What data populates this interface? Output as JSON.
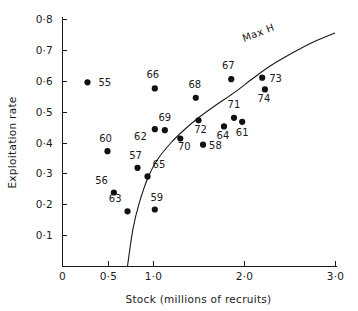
{
  "chart_data": {
    "type": "scatter",
    "title": "",
    "xlabel": "Stock (millions of recruits)",
    "ylabel": "Exploitation rate",
    "xlim": [
      0,
      3.0
    ],
    "ylim": [
      0,
      0.8
    ],
    "grid": false,
    "legend": "none",
    "xticks": [
      {
        "value": 0,
        "label": "0"
      },
      {
        "value": 0.5,
        "label": "0·5"
      },
      {
        "value": 1.0,
        "label": "1·0"
      },
      {
        "value": 2.0,
        "label": "2·0"
      },
      {
        "value": 3.0,
        "label": "3·0"
      }
    ],
    "yticks": [
      {
        "value": 0.1,
        "label": "0·1"
      },
      {
        "value": 0.2,
        "label": "0·2"
      },
      {
        "value": 0.3,
        "label": "0·3"
      },
      {
        "value": 0.4,
        "label": "0·4"
      },
      {
        "value": 0.5,
        "label": "0·5"
      },
      {
        "value": 0.6,
        "label": "0·6"
      },
      {
        "value": 0.7,
        "label": "0·7"
      },
      {
        "value": 0.8,
        "label": "0·8"
      }
    ],
    "points": [
      {
        "label": "55",
        "x": 0.28,
        "y": 0.595,
        "lx": 11,
        "ly": 4
      },
      {
        "label": "60",
        "x": 0.5,
        "y": 0.372,
        "lx": -2,
        "ly": -9
      },
      {
        "label": "56",
        "x": 0.57,
        "y": 0.238,
        "lx": -6,
        "ly": -9
      },
      {
        "label": "63",
        "x": 0.72,
        "y": 0.177,
        "lx": -6,
        "ly": -9
      },
      {
        "label": "57",
        "x": 0.83,
        "y": 0.318,
        "lx": -2,
        "ly": -9
      },
      {
        "label": "65",
        "x": 0.94,
        "y": 0.29,
        "lx": 5,
        "ly": -8
      },
      {
        "label": "59",
        "x": 1.02,
        "y": 0.183,
        "lx": 2,
        "ly": -9
      },
      {
        "label": "66",
        "x": 1.02,
        "y": 0.575,
        "lx": -2,
        "ly": -10
      },
      {
        "label": "62",
        "x": 1.02,
        "y": 0.443,
        "lx": -8,
        "ly": 11
      },
      {
        "label": "69",
        "x": 1.13,
        "y": 0.44,
        "lx": 0,
        "ly": -9
      },
      {
        "label": "70",
        "x": 1.3,
        "y": 0.413,
        "lx": 4,
        "ly": 12
      },
      {
        "label": "68",
        "x": 1.47,
        "y": 0.545,
        "lx": -1,
        "ly": -10
      },
      {
        "label": "72",
        "x": 1.5,
        "y": 0.472,
        "lx": 2,
        "ly": 13
      },
      {
        "label": "58",
        "x": 1.55,
        "y": 0.393,
        "lx": 6,
        "ly": 4
      },
      {
        "label": "64",
        "x": 1.78,
        "y": 0.452,
        "lx": -1,
        "ly": 13
      },
      {
        "label": "67",
        "x": 1.86,
        "y": 0.605,
        "lx": -3,
        "ly": -10
      },
      {
        "label": "71",
        "x": 1.89,
        "y": 0.48,
        "lx": 0,
        "ly": -10
      },
      {
        "label": "61",
        "x": 1.98,
        "y": 0.467,
        "lx": 0,
        "ly": 14
      },
      {
        "label": "73",
        "x": 2.2,
        "y": 0.61,
        "lx": 7,
        "ly": 4
      },
      {
        "label": "74",
        "x": 2.23,
        "y": 0.572,
        "lx": -1,
        "ly": 13
      }
    ],
    "annotations": [
      {
        "name": "max-h",
        "text": "Max H",
        "x": 2.17,
        "y": 0.745,
        "rotate": -21
      }
    ],
    "curve": {
      "name": "Max H curve",
      "x_start": 0.72,
      "y_start": 0.0,
      "x_end": 3.0,
      "y_end": 0.755,
      "samples": [
        {
          "x": 0.72,
          "y": 0.0
        },
        {
          "x": 0.78,
          "y": 0.12
        },
        {
          "x": 0.85,
          "y": 0.205
        },
        {
          "x": 0.95,
          "y": 0.29
        },
        {
          "x": 1.05,
          "y": 0.345
        },
        {
          "x": 1.2,
          "y": 0.4
        },
        {
          "x": 1.35,
          "y": 0.443
        },
        {
          "x": 1.5,
          "y": 0.48
        },
        {
          "x": 1.7,
          "y": 0.523
        },
        {
          "x": 1.9,
          "y": 0.563
        },
        {
          "x": 2.1,
          "y": 0.608
        },
        {
          "x": 2.3,
          "y": 0.65
        },
        {
          "x": 2.55,
          "y": 0.693
        },
        {
          "x": 2.78,
          "y": 0.728
        },
        {
          "x": 3.0,
          "y": 0.755
        }
      ]
    },
    "colors": {
      "point": "#111111",
      "axis": "#1a1a1a",
      "curve": "#1a1a1a",
      "background": "#ffffff"
    }
  }
}
